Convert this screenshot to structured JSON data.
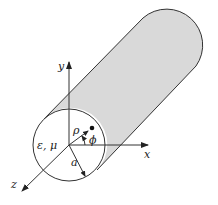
{
  "figure": {
    "labels": {
      "x_axis": "x",
      "y_axis": "y",
      "z_axis": "z",
      "material": "ε, μ",
      "rho": "ρ",
      "phi": "ϕ",
      "radius": "a"
    },
    "colors": {
      "cylinder_fill": "#d9d9d9",
      "stroke": "#333333",
      "background": "#ffffff"
    }
  }
}
